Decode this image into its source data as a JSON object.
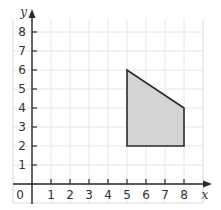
{
  "chart_data": {
    "type": "polygon-on-grid",
    "title": "",
    "xlabel": "x",
    "ylabel": "y",
    "origin_label": "0",
    "x_ticks": [
      "1",
      "2",
      "3",
      "4",
      "5",
      "6",
      "7",
      "8"
    ],
    "y_ticks": [
      "1",
      "2",
      "3",
      "4",
      "5",
      "6",
      "7",
      "8"
    ],
    "xlim": [
      -1,
      9
    ],
    "ylim": [
      -1,
      9
    ],
    "grid": true,
    "shape": {
      "vertices": [
        [
          5,
          2
        ],
        [
          5,
          6
        ],
        [
          8,
          4
        ],
        [
          8,
          2
        ]
      ],
      "fill": "#d4d4d4",
      "stroke": "#2a2a2a"
    }
  },
  "colors": {
    "grid": "#e6e6e6",
    "axis": "#2a2a2a",
    "fill": "#d4d4d4"
  }
}
